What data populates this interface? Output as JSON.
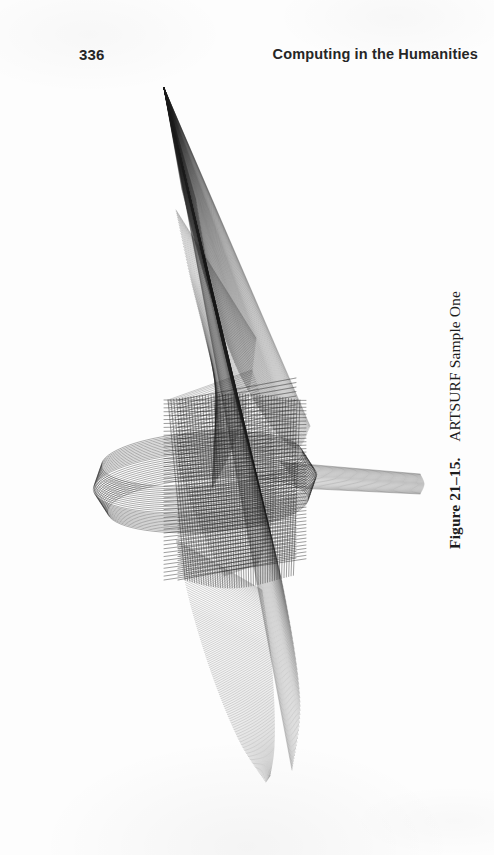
{
  "page": {
    "folio": "336",
    "running_head": "Computing in the Humanities",
    "background_color": "#fdfdfd",
    "ink_color": "#1c1c1c",
    "width": 494,
    "height": 855
  },
  "figure": {
    "caption_label": "Figure 21–15.",
    "caption_text": "ARTSURF Sample One",
    "caption_separator": "  ",
    "caption_rotation_deg": -90,
    "alt": "Dense black-and-white wireframe line drawing of a ruled mathematical surface",
    "stroke_color": "#1c1c1c"
  },
  "chart_data": {
    "type": "line",
    "title": "ARTSURF Sample One",
    "subtitle": "",
    "xlabel": "",
    "ylabel": "",
    "grid": false,
    "legend": "none",
    "axes_visible": false,
    "tick_labels": [],
    "annotations": [],
    "render": "wireframe-ruled-surface",
    "canvas": {
      "x": 0,
      "y": 70,
      "width": 430,
      "height": 720
    },
    "xlim": [
      0,
      430
    ],
    "ylim": [
      0,
      720
    ],
    "line_width": 0.45,
    "families": [
      {
        "name": "outer-triangular-fan",
        "kind": "ruled",
        "count": 120,
        "opacity": 0.5,
        "width": 0.4,
        "rail_a": {
          "type": "point",
          "x": 164,
          "y": 18
        },
        "rail_b": {
          "type": "polyline",
          "points": [
            [
              196,
              130
            ],
            [
              214,
              232
            ],
            [
              236,
              330
            ],
            [
              262,
              430
            ],
            [
              286,
              532
            ],
            [
              300,
              632
            ],
            [
              292,
              700
            ]
          ]
        }
      },
      {
        "name": "right-sail-edge",
        "kind": "ruled",
        "count": 110,
        "opacity": 0.55,
        "width": 0.4,
        "rail_a": {
          "type": "point",
          "x": 164,
          "y": 18
        },
        "rail_b": {
          "type": "polyline",
          "points": [
            [
              182,
              120
            ],
            [
              206,
              212
            ],
            [
              236,
              296
            ],
            [
              268,
              352
            ],
            [
              296,
              378
            ],
            [
              310,
              356
            ]
          ]
        }
      },
      {
        "name": "inner-lobe-upper",
        "kind": "ruled",
        "count": 95,
        "opacity": 0.6,
        "width": 0.4,
        "rail_a": {
          "type": "polyline",
          "points": [
            [
              176,
              140
            ],
            [
              190,
              206
            ],
            [
              204,
              262
            ],
            [
              214,
              306
            ],
            [
              216,
              342
            ]
          ]
        },
        "rail_b": {
          "type": "polyline",
          "points": [
            [
              256,
              268
            ],
            [
              250,
              316
            ],
            [
              240,
              358
            ],
            [
              226,
              392
            ],
            [
              212,
              418
            ]
          ]
        }
      },
      {
        "name": "inner-lobe-lower",
        "kind": "ruled",
        "count": 95,
        "opacity": 0.6,
        "width": 0.4,
        "rail_a": {
          "type": "polyline",
          "points": [
            [
              168,
              330
            ],
            [
              176,
              384
            ],
            [
              190,
              430
            ],
            [
              206,
              470
            ],
            [
              224,
              506
            ]
          ]
        },
        "rail_b": {
          "type": "polyline",
          "points": [
            [
              252,
              300
            ],
            [
              268,
              352
            ],
            [
              276,
              404
            ],
            [
              272,
              452
            ],
            [
              258,
              494
            ]
          ]
        }
      },
      {
        "name": "lower-tail-fan",
        "kind": "ruled",
        "count": 130,
        "opacity": 0.5,
        "width": 0.4,
        "rail_a": {
          "type": "polyline",
          "points": [
            [
              176,
              470
            ],
            [
              192,
              540
            ],
            [
              214,
              610
            ],
            [
              240,
              672
            ],
            [
              266,
              712
            ]
          ]
        },
        "rail_b": {
          "type": "polyline",
          "points": [
            [
              262,
              520
            ],
            [
              270,
              578
            ],
            [
              274,
              634
            ],
            [
              274,
              678
            ],
            [
              270,
              706
            ]
          ]
        }
      },
      {
        "name": "core-mesh-warp",
        "kind": "grid",
        "count": 46,
        "opacity": 0.78,
        "width": 0.55,
        "bounds": {
          "x0": 168,
          "y0": 330,
          "x1": 300,
          "y1": 510
        }
      },
      {
        "name": "core-mesh-weft",
        "kind": "grid",
        "count": 46,
        "opacity": 0.78,
        "width": 0.55,
        "bounds": {
          "x0": 168,
          "y0": 330,
          "x1": 300,
          "y1": 510
        }
      },
      {
        "name": "horizontal-disc",
        "kind": "ellipse-stack",
        "count": 26,
        "opacity": 0.7,
        "width": 0.5,
        "center": {
          "x": 205,
          "y": 412
        },
        "rx": 112,
        "ry": 30,
        "thickness": 46
      },
      {
        "name": "right-spike",
        "kind": "ruled",
        "count": 22,
        "opacity": 0.6,
        "width": 0.45,
        "rail_a": {
          "type": "polyline",
          "points": [
            [
              280,
              392
            ],
            [
              290,
              404
            ],
            [
              296,
              418
            ]
          ]
        },
        "rail_b": {
          "type": "polyline",
          "points": [
            [
              420,
              404
            ],
            [
              424,
              414
            ],
            [
              420,
              424
            ]
          ]
        }
      }
    ]
  }
}
